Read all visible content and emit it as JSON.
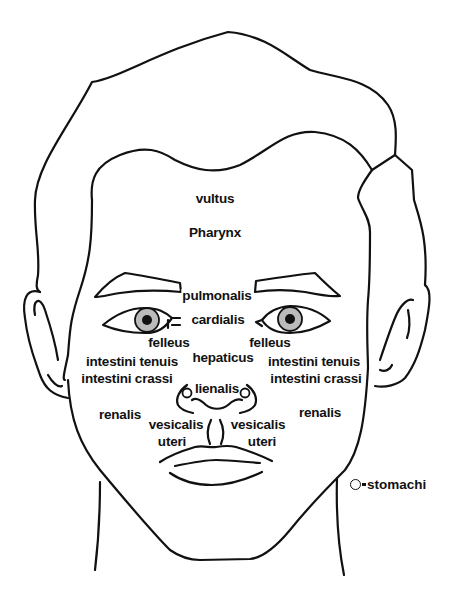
{
  "diagram": {
    "stroke_color": "#111111",
    "background_color": "#ffffff",
    "labels": {
      "vultus": "vultus",
      "pharynx": "Pharynx",
      "pulmonalis": "pulmonalis",
      "cardialis": "cardialis",
      "felleus_left": "felleus",
      "felleus_right": "felleus",
      "hepaticus": "hepaticus",
      "intestini_tenuis_left": "intestini tenuis",
      "intestini_tenuis_right": "intestini tenuis",
      "intestini_crassi_left": "intestini crassi",
      "intestini_crassi_right": "intestini crassi",
      "lienalis": "lienalis",
      "renalis_left": "renalis",
      "renalis_right": "renalis",
      "vesicalis_left": "vesicalis",
      "vesicalis_right": "vesicalis",
      "uteri_left": "uteri",
      "uteri_right": "uteri"
    },
    "legend": {
      "symbol": "circle-icon",
      "separator": "=",
      "text": "stomachi"
    }
  }
}
